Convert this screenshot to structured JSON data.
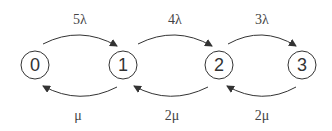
{
  "diagram": {
    "type": "state-transition",
    "nodes": [
      {
        "id": "0",
        "label": "0",
        "cx": 35,
        "cy": 65
      },
      {
        "id": "1",
        "label": "1",
        "cx": 123,
        "cy": 65
      },
      {
        "id": "2",
        "label": "2",
        "cx": 219,
        "cy": 65
      },
      {
        "id": "3",
        "label": "3",
        "cx": 302,
        "cy": 65
      }
    ],
    "forward_edges": [
      {
        "from": "0",
        "to": "1",
        "label": "5λ"
      },
      {
        "from": "1",
        "to": "2",
        "label": "4λ"
      },
      {
        "from": "2",
        "to": "3",
        "label": "3λ"
      }
    ],
    "backward_edges": [
      {
        "from": "1",
        "to": "0",
        "label": "μ"
      },
      {
        "from": "2",
        "to": "1",
        "label": "2μ"
      },
      {
        "from": "3",
        "to": "2",
        "label": "2μ"
      }
    ],
    "colors": {
      "stroke": "#333333",
      "text": "#444444"
    }
  }
}
